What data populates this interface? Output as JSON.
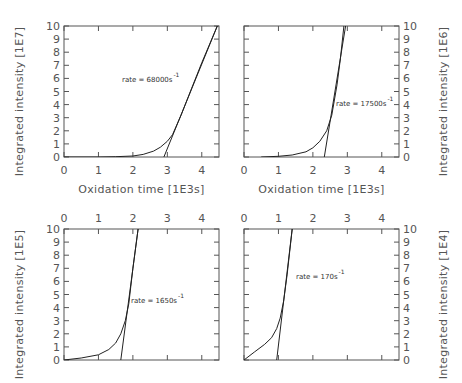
{
  "chart_data": [
    {
      "type": "line",
      "panel": "top-left",
      "xlabel": "Oxidation time [1E3s]",
      "ylabel": "Integrated intensity [1E7]",
      "xlim": [
        0,
        4.5
      ],
      "ylim": [
        0,
        10
      ],
      "xticks": [
        "0",
        "1",
        "2",
        "3",
        "4"
      ],
      "yticks": [
        "0",
        "1",
        "2",
        "3",
        "4",
        "5",
        "6",
        "7",
        "8",
        "9",
        "10"
      ],
      "x_axis_position": "bottom",
      "y_axis_position": "left",
      "annotation": {
        "text": "rate = 68000s",
        "superscript": "-1"
      },
      "series": [
        {
          "name": "data curve",
          "x": [
            0,
            1.0,
            1.5,
            2.0,
            2.3,
            2.6,
            2.8,
            3.0,
            3.15,
            3.4,
            3.7,
            4.0,
            4.45
          ],
          "y": [
            0,
            0,
            0.02,
            0.08,
            0.2,
            0.45,
            0.75,
            1.2,
            1.7,
            3.2,
            5.2,
            7.2,
            10
          ]
        },
        {
          "name": "linear fit",
          "x": [
            2.9,
            4.45
          ],
          "y": [
            0,
            10
          ]
        }
      ]
    },
    {
      "type": "line",
      "panel": "top-right",
      "xlabel": "Oxidation time [1E3s]",
      "ylabel": "Integrated intensity [1E6]",
      "xlim": [
        0,
        4.5
      ],
      "ylim": [
        0,
        10
      ],
      "xticks": [
        "0",
        "1",
        "2",
        "3",
        "4"
      ],
      "yticks": [
        "0",
        "1",
        "2",
        "3",
        "4",
        "5",
        "6",
        "7",
        "8",
        "9",
        "10"
      ],
      "x_axis_position": "bottom",
      "y_axis_position": "right",
      "annotation": {
        "text": "rate = 17500s",
        "superscript": "-1"
      },
      "series": [
        {
          "name": "data curve",
          "x": [
            0.5,
            1.0,
            1.4,
            1.8,
            2.0,
            2.2,
            2.4,
            2.55,
            2.7,
            2.8,
            2.9
          ],
          "y": [
            0,
            0.05,
            0.15,
            0.4,
            0.7,
            1.2,
            2.0,
            3.2,
            5.5,
            7.5,
            10
          ]
        },
        {
          "name": "linear fit",
          "x": [
            2.33,
            2.95
          ],
          "y": [
            0,
            10
          ]
        }
      ]
    },
    {
      "type": "line",
      "panel": "bottom-left",
      "xlabel": "",
      "ylabel": "Integrated intensity [1E5]",
      "xlim": [
        0,
        4.5
      ],
      "ylim": [
        0,
        10
      ],
      "xticks": [
        "0",
        "1",
        "2",
        "3",
        "4"
      ],
      "yticks": [
        "0",
        "1",
        "2",
        "3",
        "4",
        "5",
        "6",
        "7",
        "8",
        "9",
        "10"
      ],
      "x_axis_position": "top",
      "y_axis_position": "left",
      "annotation": {
        "text": "rate = 1650s",
        "superscript": "-1"
      },
      "series": [
        {
          "name": "data curve",
          "x": [
            0,
            0.5,
            1.0,
            1.3,
            1.5,
            1.65,
            1.78,
            1.88,
            2.0,
            2.15
          ],
          "y": [
            0,
            0.15,
            0.4,
            0.8,
            1.3,
            2.0,
            3.0,
            4.3,
            7.0,
            10
          ]
        },
        {
          "name": "linear fit",
          "x": [
            1.65,
            2.15
          ],
          "y": [
            0,
            10
          ]
        }
      ]
    },
    {
      "type": "line",
      "panel": "bottom-right",
      "xlabel": "",
      "ylabel": "Integrated intensity [1E4]",
      "xlim": [
        0,
        4.5
      ],
      "ylim": [
        0,
        10
      ],
      "xticks": [
        "0",
        "1",
        "2",
        "3",
        "4"
      ],
      "yticks": [
        "0",
        "1",
        "2",
        "3",
        "4",
        "5",
        "6",
        "7",
        "8",
        "9",
        "10"
      ],
      "x_axis_position": "top",
      "y_axis_position": "right",
      "annotation": {
        "text": "rate = 170s",
        "superscript": "-1"
      },
      "series": [
        {
          "name": "data curve",
          "x": [
            0,
            0.3,
            0.6,
            0.8,
            0.95,
            1.05,
            1.15,
            1.25,
            1.4
          ],
          "y": [
            0,
            0.6,
            1.2,
            1.7,
            2.4,
            3.2,
            4.5,
            6.5,
            10
          ]
        },
        {
          "name": "linear fit",
          "x": [
            0.95,
            1.4
          ],
          "y": [
            0,
            10
          ]
        }
      ]
    }
  ],
  "style": {
    "frame_color": "#555555",
    "curve_color": "#222222",
    "text_color": "#555555"
  }
}
